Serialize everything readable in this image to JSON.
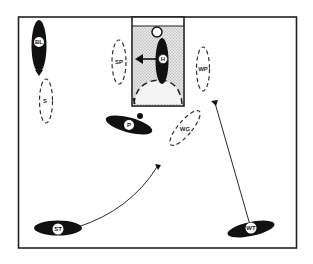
{
  "diagram": {
    "colors": {
      "ink": "#1a1a1a",
      "paper": "#ffffff",
      "goal_fill": "#d9d9d9",
      "outline": "#333333"
    },
    "players": [
      {
        "id": "BL",
        "label": "BL",
        "style": "solid",
        "role": "player"
      },
      {
        "id": "H",
        "label": "H",
        "style": "solid",
        "role": "player"
      },
      {
        "id": "P",
        "label": "P",
        "style": "solid",
        "role": "player"
      },
      {
        "id": "ST",
        "label": "ST",
        "style": "solid",
        "role": "player"
      },
      {
        "id": "WT",
        "label": "WT",
        "style": "solid",
        "role": "player"
      },
      {
        "id": "SP",
        "label": "SP",
        "style": "dashed",
        "role": "player-position"
      },
      {
        "id": "S",
        "label": "S",
        "style": "dashed",
        "role": "player-position"
      },
      {
        "id": "WP",
        "label": "WP",
        "style": "dashed",
        "role": "player-position"
      },
      {
        "id": "WG",
        "label": "WG",
        "style": "dashed",
        "role": "player-position"
      }
    ],
    "arrows": [
      {
        "from": "H",
        "direction": "left",
        "type": "movement-arrow"
      },
      {
        "from": "ST",
        "to": "point-near-WG",
        "type": "curved-path"
      },
      {
        "from": "WT",
        "to": "point-near-WP",
        "type": "straight-path"
      }
    ],
    "field": {
      "goal_area": "shaded-rectangle-top-center",
      "semicircle": "dashed-arc-in-goal-area"
    }
  }
}
